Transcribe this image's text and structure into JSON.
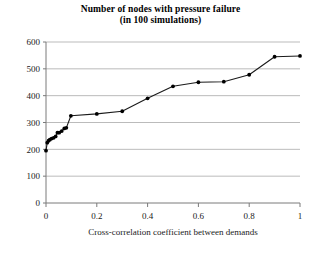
{
  "chart_data": {
    "type": "line",
    "title": "Number of nodes with pressure failure",
    "subtitle": "(in 100 simulations)",
    "xlabel": "Cross-correlation coefficient between demands",
    "ylabel": "",
    "xlim": [
      0,
      1
    ],
    "ylim": [
      0,
      600
    ],
    "xticks": [
      "0",
      "0.2",
      "0.4",
      "0.6",
      "0.8",
      "1"
    ],
    "xtick_values": [
      0,
      0.2,
      0.4,
      0.6,
      0.8,
      1
    ],
    "yticks": [
      "0",
      "100",
      "200",
      "300",
      "400",
      "500",
      "600"
    ],
    "ytick_values": [
      0,
      100,
      200,
      300,
      400,
      500,
      600
    ],
    "grid": "horizontal",
    "legend": "none",
    "marker": "filled-diamond",
    "line_color": "#1a1a1a",
    "marker_color": "#000000",
    "series": [
      {
        "name": "Number of nodes with pressure failure",
        "points": [
          [
            0.0,
            195
          ],
          [
            0.005,
            225
          ],
          [
            0.01,
            232
          ],
          [
            0.015,
            236
          ],
          [
            0.022,
            240
          ],
          [
            0.03,
            243
          ],
          [
            0.038,
            248
          ],
          [
            0.045,
            262
          ],
          [
            0.052,
            262
          ],
          [
            0.062,
            268
          ],
          [
            0.072,
            278
          ],
          [
            0.08,
            280
          ],
          [
            0.098,
            325
          ],
          [
            0.2,
            332
          ],
          [
            0.3,
            342
          ],
          [
            0.4,
            390
          ],
          [
            0.5,
            435
          ],
          [
            0.6,
            450
          ],
          [
            0.7,
            452
          ],
          [
            0.8,
            478
          ],
          [
            0.9,
            545
          ],
          [
            1.0,
            548
          ]
        ]
      }
    ]
  }
}
